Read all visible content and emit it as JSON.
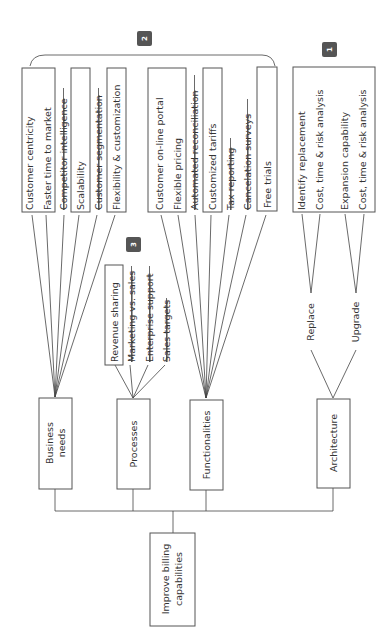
{
  "diagram": {
    "root": {
      "label": "Improve billing capabilities",
      "lines": [
        "Improve billing",
        "capabilities"
      ]
    },
    "branches": [
      {
        "id": "business-needs",
        "label": "Business needs",
        "lines": [
          "Business",
          "needs"
        ]
      },
      {
        "id": "processes",
        "label": "Processes",
        "lines": [
          "Processes"
        ]
      },
      {
        "id": "functionalities",
        "label": "Functionalities",
        "lines": [
          "Functionalities"
        ]
      },
      {
        "id": "architecture",
        "label": "Architecture",
        "lines": [
          "Architecture"
        ]
      }
    ],
    "business_needs_items": [
      {
        "label": "Customer centricity",
        "struck": false,
        "boxed": true
      },
      {
        "label": "Faster time to market",
        "struck": false,
        "boxed": true
      },
      {
        "label": "Competitor intelligence",
        "struck": true,
        "boxed": false
      },
      {
        "label": "Scalability",
        "struck": false,
        "boxed": true
      },
      {
        "label": "Customer segmentation",
        "struck": true,
        "boxed": false
      },
      {
        "label": "Flexibility & customization",
        "struck": false,
        "boxed": true
      }
    ],
    "processes_items": [
      {
        "label": "Revenue sharing",
        "struck": false,
        "boxed": true
      },
      {
        "label": "Marketing vs. sales",
        "struck": true,
        "boxed": false
      },
      {
        "label": "Enterprise support",
        "struck": true,
        "boxed": false
      },
      {
        "label": "Sales targets",
        "struck": true,
        "boxed": false
      }
    ],
    "functionalities_items": [
      {
        "label": "Customer on-line portal",
        "struck": false,
        "boxed": true
      },
      {
        "label": "Flexible pricing",
        "struck": false,
        "boxed": true
      },
      {
        "label": "Automated reconciliation",
        "struck": true,
        "boxed": false
      },
      {
        "label": "Customized tariffs",
        "struck": false,
        "boxed": true
      },
      {
        "label": "Tax reporting",
        "struck": true,
        "boxed": false
      },
      {
        "label": "Cancelation surveys",
        "struck": true,
        "boxed": false
      },
      {
        "label": "Free trials",
        "struck": false,
        "boxed": true
      }
    ],
    "architecture_options": [
      {
        "label": "Replace",
        "items": [
          "Identify replacement",
          "Cost, time & risk analysis"
        ]
      },
      {
        "label": "Upgrade",
        "items": [
          "Expansion capability",
          "Cost, time & risk analysis"
        ]
      }
    ],
    "badges": [
      {
        "number": "1",
        "target": "architecture"
      },
      {
        "number": "2",
        "target": "business-needs-and-functionalities"
      },
      {
        "number": "3",
        "target": "processes"
      }
    ],
    "colors": {
      "line": "#444444",
      "box_border": "#555555",
      "badge_fill": "#555555",
      "text": "#333333"
    }
  }
}
